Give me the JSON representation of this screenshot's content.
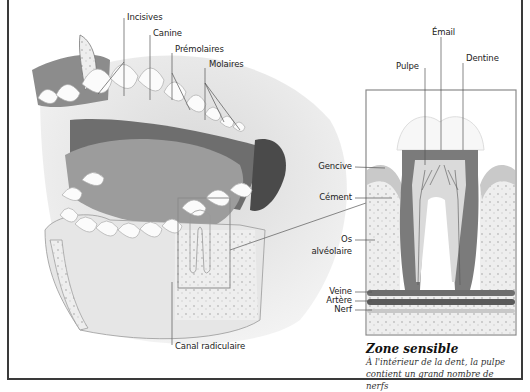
{
  "diagram": {
    "type": "anatomical illustration",
    "labels_mouth": {
      "incisives": "Incisives",
      "canine": "Canine",
      "premolaires": "Prémolaires",
      "molaires": "Molaires",
      "canal": "Canal radiculaire"
    },
    "labels_tooth": {
      "email": "Émail",
      "pulpe": "Pulpe",
      "dentine": "Dentine",
      "gencive": "Gencive",
      "cement": "Cément",
      "os_line1": "Os",
      "os_line2": "alvéolaire",
      "veine": "Veine",
      "artere": "Artère",
      "nerf": "Nerf"
    },
    "caption": {
      "title": "Zone sensible",
      "body": "À l'intérieur de la dent, la pulpe contient un grand nombre de nerfs"
    },
    "colors": {
      "frame": "#3a3a3a",
      "gum": "#8a8a8a",
      "tooth": "#ffffff",
      "dentine": "#7a7a7a",
      "pulp": "#dadada",
      "bone": "#ececec",
      "leader_line": "#6a6a6a"
    }
  }
}
